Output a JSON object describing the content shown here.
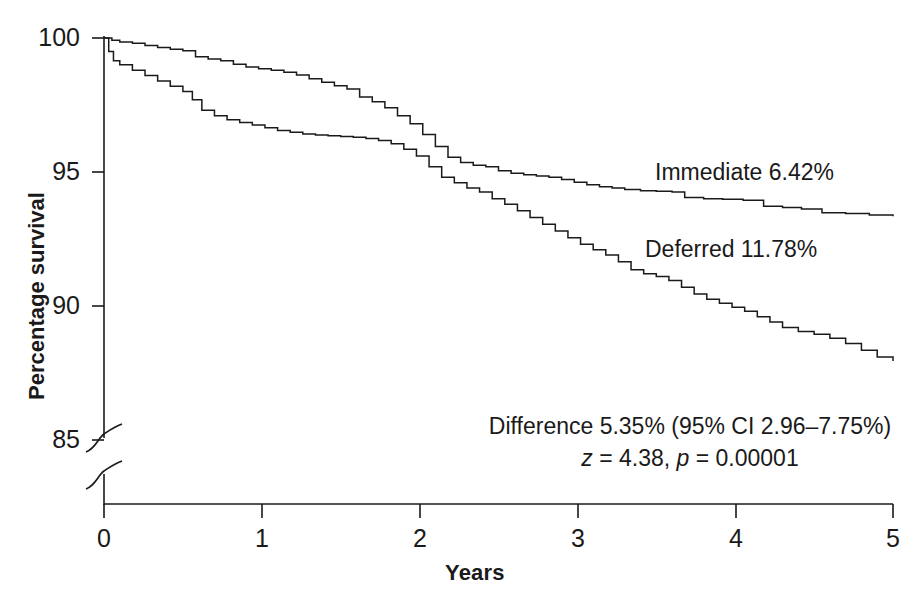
{
  "chart_data": {
    "type": "line",
    "title": "",
    "subtitle": "",
    "xlabel": "Years",
    "ylabel": "Percentage survival",
    "xlim": [
      0,
      5
    ],
    "ylim": [
      85,
      100
    ],
    "grid": false,
    "legend_position": "inline-annotation",
    "axis_break": {
      "present": true,
      "between": [
        0,
        85
      ],
      "note": "broken y-axis below 85"
    },
    "xticks": [
      "0",
      "1",
      "2",
      "3",
      "4",
      "5"
    ],
    "xtick_values": [
      0,
      1,
      2,
      3,
      4,
      5
    ],
    "yticks": [
      "85",
      "90",
      "95",
      "100"
    ],
    "ytick_values": [
      85,
      90,
      95,
      100
    ],
    "series": [
      {
        "name": "Immediate",
        "label": "Immediate 6.42%",
        "final_event_rate_percent": 6.42,
        "color": "#1a1a1a",
        "points": [
          [
            0.0,
            100.0
          ],
          [
            0.05,
            99.92
          ],
          [
            0.1,
            99.85
          ],
          [
            0.18,
            99.8
          ],
          [
            0.26,
            99.72
          ],
          [
            0.34,
            99.65
          ],
          [
            0.42,
            99.58
          ],
          [
            0.5,
            99.52
          ],
          [
            0.58,
            99.3
          ],
          [
            0.66,
            99.22
          ],
          [
            0.74,
            99.15
          ],
          [
            0.82,
            99.02
          ],
          [
            0.9,
            98.92
          ],
          [
            0.98,
            98.85
          ],
          [
            1.06,
            98.8
          ],
          [
            1.14,
            98.72
          ],
          [
            1.22,
            98.62
          ],
          [
            1.3,
            98.48
          ],
          [
            1.38,
            98.35
          ],
          [
            1.46,
            98.22
          ],
          [
            1.54,
            98.1
          ],
          [
            1.62,
            97.8
          ],
          [
            1.7,
            97.62
          ],
          [
            1.78,
            97.4
          ],
          [
            1.86,
            97.1
          ],
          [
            1.94,
            96.8
          ],
          [
            2.02,
            96.4
          ],
          [
            2.1,
            95.95
          ],
          [
            2.18,
            95.55
          ],
          [
            2.26,
            95.35
          ],
          [
            2.34,
            95.25
          ],
          [
            2.42,
            95.2
          ],
          [
            2.5,
            95.05
          ],
          [
            2.58,
            94.95
          ],
          [
            2.66,
            94.9
          ],
          [
            2.74,
            94.85
          ],
          [
            2.82,
            94.8
          ],
          [
            2.9,
            94.72
          ],
          [
            2.98,
            94.62
          ],
          [
            3.06,
            94.52
          ],
          [
            3.14,
            94.45
          ],
          [
            3.22,
            94.4
          ],
          [
            3.3,
            94.35
          ],
          [
            3.4,
            94.3
          ],
          [
            3.5,
            94.28
          ],
          [
            3.6,
            94.25
          ],
          [
            3.68,
            94.05
          ],
          [
            3.8,
            94.0
          ],
          [
            3.92,
            93.98
          ],
          [
            4.05,
            93.95
          ],
          [
            4.18,
            93.72
          ],
          [
            4.3,
            93.68
          ],
          [
            4.42,
            93.62
          ],
          [
            4.55,
            93.48
          ],
          [
            4.7,
            93.45
          ],
          [
            4.85,
            93.4
          ],
          [
            5.0,
            93.35
          ]
        ]
      },
      {
        "name": "Deferred",
        "label": "Deferred 11.78%",
        "final_event_rate_percent": 11.78,
        "color": "#1a1a1a",
        "points": [
          [
            0.0,
            100.0
          ],
          [
            0.03,
            99.5
          ],
          [
            0.06,
            99.15
          ],
          [
            0.1,
            99.0
          ],
          [
            0.18,
            98.8
          ],
          [
            0.26,
            98.6
          ],
          [
            0.34,
            98.4
          ],
          [
            0.42,
            98.2
          ],
          [
            0.5,
            98.0
          ],
          [
            0.56,
            97.7
          ],
          [
            0.62,
            97.3
          ],
          [
            0.7,
            97.1
          ],
          [
            0.78,
            96.95
          ],
          [
            0.86,
            96.85
          ],
          [
            0.94,
            96.75
          ],
          [
            1.02,
            96.65
          ],
          [
            1.1,
            96.55
          ],
          [
            1.18,
            96.48
          ],
          [
            1.26,
            96.42
          ],
          [
            1.34,
            96.38
          ],
          [
            1.42,
            96.35
          ],
          [
            1.5,
            96.32
          ],
          [
            1.58,
            96.3
          ],
          [
            1.66,
            96.25
          ],
          [
            1.74,
            96.18
          ],
          [
            1.82,
            96.05
          ],
          [
            1.9,
            95.85
          ],
          [
            1.98,
            95.6
          ],
          [
            2.06,
            95.2
          ],
          [
            2.14,
            94.8
          ],
          [
            2.22,
            94.6
          ],
          [
            2.3,
            94.4
          ],
          [
            2.38,
            94.25
          ],
          [
            2.46,
            94.0
          ],
          [
            2.54,
            93.8
          ],
          [
            2.62,
            93.55
          ],
          [
            2.7,
            93.3
          ],
          [
            2.78,
            93.05
          ],
          [
            2.86,
            92.8
          ],
          [
            2.94,
            92.55
          ],
          [
            3.02,
            92.3
          ],
          [
            3.1,
            92.1
          ],
          [
            3.18,
            91.9
          ],
          [
            3.26,
            91.65
          ],
          [
            3.34,
            91.35
          ],
          [
            3.42,
            91.2
          ],
          [
            3.5,
            91.1
          ],
          [
            3.58,
            90.95
          ],
          [
            3.66,
            90.7
          ],
          [
            3.74,
            90.45
          ],
          [
            3.82,
            90.25
          ],
          [
            3.9,
            90.1
          ],
          [
            3.98,
            89.95
          ],
          [
            4.06,
            89.8
          ],
          [
            4.14,
            89.6
          ],
          [
            4.22,
            89.4
          ],
          [
            4.3,
            89.2
          ],
          [
            4.4,
            89.05
          ],
          [
            4.5,
            88.95
          ],
          [
            4.6,
            88.8
          ],
          [
            4.7,
            88.6
          ],
          [
            4.8,
            88.35
          ],
          [
            4.9,
            88.1
          ],
          [
            5.0,
            87.95
          ]
        ]
      }
    ],
    "annotations": [
      {
        "id": "immediate-label",
        "text": "Immediate 6.42%"
      },
      {
        "id": "deferred-label",
        "text": "Deferred 11.78%"
      },
      {
        "id": "stat-line-1",
        "text": "Difference 5.35% (95% CI 2.96–7.75%)"
      },
      {
        "id": "stat-line-2-z",
        "text": "z",
        "text_rest": " = 4.38, "
      },
      {
        "id": "stat-line-2-p",
        "text": "p",
        "text_rest": " = 0.00001"
      }
    ],
    "statistics": {
      "difference_percent": 5.35,
      "ci_level": "95% CI",
      "ci_low": 2.96,
      "ci_high": 7.75,
      "z": 4.38,
      "p": 1e-05
    }
  },
  "axes": {
    "y_title": "Percentage survival",
    "x_title": "Years",
    "y_tick_labels": [
      "100",
      "95",
      "90",
      "85"
    ],
    "x_tick_labels": [
      "0",
      "1",
      "2",
      "3",
      "4",
      "5"
    ]
  },
  "annotations": {
    "immediate": "Immediate 6.42%",
    "deferred": "Deferred 11.78%",
    "difference": "Difference 5.35% (95% CI 2.96–7.75%)",
    "z_symbol": "z",
    "z_value": " = 4.38, ",
    "p_symbol": "p",
    "p_value": " = 0.00001"
  },
  "colors": {
    "line": "#1a1a1a",
    "axis": "#1a1a1a",
    "background": "#ffffff"
  }
}
